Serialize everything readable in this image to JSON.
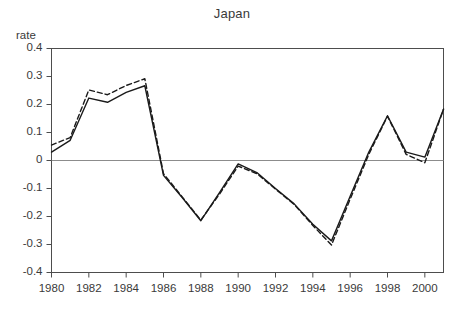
{
  "chart_data": {
    "type": "line",
    "title": "Japan",
    "xlabel": "",
    "ylabel": "rate",
    "xlim": [
      1980,
      2001
    ],
    "ylim": [
      -0.4,
      0.4
    ],
    "grid": false,
    "legend": "none",
    "zero_line": true,
    "x": [
      1980,
      1981,
      1982,
      1983,
      1984,
      1985,
      1986,
      1987,
      1988,
      1989,
      1990,
      1991,
      1992,
      1993,
      1994,
      1995,
      1996,
      1997,
      1998,
      1999,
      2000,
      2001
    ],
    "ytick_labels": [
      "0.4",
      "0.3",
      "0.2",
      "0.1",
      "0",
      "-0.1",
      "-0.2",
      "-0.3",
      "-0.4"
    ],
    "ytick_values": [
      0.4,
      0.3,
      0.2,
      0.1,
      0,
      -0.1,
      -0.2,
      -0.3,
      -0.4
    ],
    "xtick_labels": [
      "1980",
      "1982",
      "1984",
      "1986",
      "1988",
      "1990",
      "1992",
      "1994",
      "1996",
      "1998",
      "2000"
    ],
    "xtick_values": [
      1980,
      1982,
      1984,
      1986,
      1988,
      1990,
      1992,
      1994,
      1996,
      1998,
      2000
    ],
    "series": [
      {
        "name": "solid",
        "style": "solid",
        "color": "#1a1a1a",
        "values": [
          0.03,
          0.072,
          0.223,
          0.208,
          0.243,
          0.267,
          -0.053,
          -0.132,
          -0.215,
          -0.115,
          -0.012,
          -0.043,
          -0.1,
          -0.155,
          -0.228,
          -0.287,
          -0.128,
          0.03,
          0.16,
          0.03,
          0.012,
          0.183
        ]
      },
      {
        "name": "dashed",
        "style": "dashed",
        "color": "#1a1a1a",
        "values": [
          0.055,
          0.082,
          0.252,
          0.235,
          0.268,
          0.292,
          -0.047,
          -0.13,
          -0.213,
          -0.12,
          -0.02,
          -0.047,
          -0.102,
          -0.157,
          -0.232,
          -0.302,
          -0.138,
          0.022,
          0.158,
          0.022,
          -0.008,
          0.183
        ]
      }
    ]
  },
  "axes": {
    "frame_color": "#4d4d4d",
    "zero_line_color": "#8c8c8c"
  }
}
